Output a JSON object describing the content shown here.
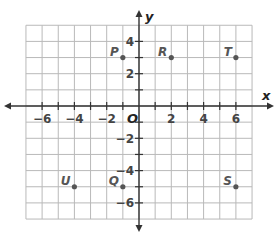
{
  "chart_data": {
    "type": "scatter",
    "title": "",
    "xlabel": "x",
    "ylabel": "y",
    "origin_label": "O",
    "xlim": [
      -7,
      7
    ],
    "ylim": [
      -7,
      5
    ],
    "grid": true,
    "x_ticks": [
      -6,
      -4,
      -2,
      2,
      4,
      6
    ],
    "y_ticks": [
      4,
      2,
      -2,
      -4,
      -6
    ],
    "x_tick_labels": [
      "-6",
      "-4",
      "-2",
      "2",
      "4",
      "6"
    ],
    "y_tick_labels": [
      "4",
      "2",
      "-2",
      "-4",
      "-6"
    ],
    "points": [
      {
        "label": "P",
        "x": -1,
        "y": 3
      },
      {
        "label": "R",
        "x": 2,
        "y": 3
      },
      {
        "label": "T",
        "x": 6,
        "y": 3
      },
      {
        "label": "U",
        "x": -4,
        "y": -5
      },
      {
        "label": "Q",
        "x": -1,
        "y": -5
      },
      {
        "label": "S",
        "x": 6,
        "y": -5
      }
    ],
    "colors": {
      "grid": "#b9b9b9",
      "axis": "#333333",
      "point": "#555555"
    }
  }
}
